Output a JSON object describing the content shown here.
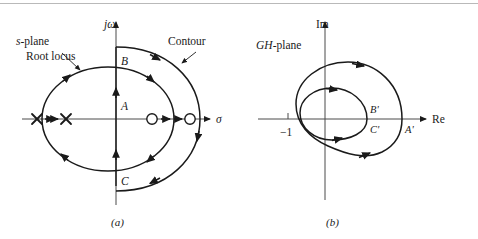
{
  "figure": {
    "caption_a": "(a)",
    "caption_b": "(b)"
  },
  "panel_a": {
    "plane_label_italic": "s",
    "plane_label_rest": "-plane",
    "annotation_root_locus": "Root locus",
    "annotation_contour": "Contour",
    "axis_vertical": "jω",
    "axis_horizontal": "σ",
    "point_b": "B",
    "point_a": "A",
    "point_c": "C",
    "poles": [
      "x",
      "x"
    ],
    "zeros": [
      "o",
      "o"
    ]
  },
  "panel_b": {
    "plane_label_italic": "GH",
    "plane_label_rest": "-plane",
    "axis_vertical": "Im",
    "axis_horizontal": "Re",
    "tick_minus_one": "−1",
    "point_b_prime": "B'",
    "point_c_prime": "C'",
    "point_a_prime": "A'"
  },
  "colors": {
    "ink": "#1a1a1a",
    "axis": "#4a4a4a",
    "rule": "#b9b9b9",
    "paper": "#ffffff"
  }
}
